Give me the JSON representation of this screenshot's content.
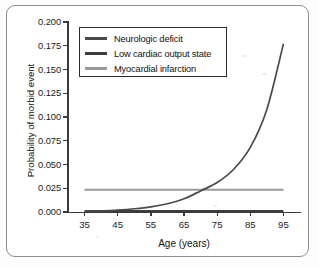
{
  "figure": {
    "background_color": "#ffffff",
    "frame_color": "#8e8e8e",
    "axis_color": "#3b3b3b"
  },
  "chart_data": {
    "type": "line",
    "title": "",
    "xlabel": "Age (years)",
    "ylabel": "Probability of morbid event",
    "xlim": [
      30,
      100
    ],
    "ylim": [
      0.0,
      0.2
    ],
    "x_ticks": [
      35,
      45,
      55,
      65,
      75,
      85,
      95
    ],
    "x_tick_labels": [
      "35",
      "45",
      "55",
      "65",
      "75",
      "85",
      "95"
    ],
    "y_ticks": [
      0.0,
      0.025,
      0.05,
      0.075,
      0.1,
      0.125,
      0.15,
      0.175,
      0.2
    ],
    "y_tick_labels": [
      "0.000",
      "0.025",
      "0.050",
      "0.075",
      "0.100",
      "0.125",
      "0.150",
      "0.175",
      "0.200"
    ],
    "grid": false,
    "legend_position": "upper left",
    "x": [
      35,
      40,
      45,
      50,
      55,
      60,
      65,
      70,
      75,
      80,
      85,
      90,
      95
    ],
    "series": [
      {
        "name": "Neurologic deficit",
        "color": "#4a4a4a",
        "values": [
          0.0008,
          0.0013,
          0.0021,
          0.0034,
          0.0054,
          0.0087,
          0.0139,
          0.0222,
          0.031,
          0.045,
          0.068,
          0.108,
          0.177
        ]
      },
      {
        "name": "Low cardiac output state",
        "color": "#3c3c3c",
        "values": [
          0.001,
          0.001,
          0.001,
          0.001,
          0.001,
          0.001,
          0.001,
          0.001,
          0.001,
          0.001,
          0.001,
          0.001,
          0.001
        ]
      },
      {
        "name": "Myocardial infarction",
        "color": "#9a9a9a",
        "values": [
          0.0235,
          0.0235,
          0.0235,
          0.0235,
          0.0235,
          0.0235,
          0.0235,
          0.0235,
          0.0235,
          0.0235,
          0.0235,
          0.0235,
          0.0235
        ]
      }
    ]
  },
  "legend": {
    "entries": [
      {
        "label": "Neurologic deficit",
        "color": "#4a4a4a"
      },
      {
        "label": "Low cardiac output state",
        "color": "#3c3c3c"
      },
      {
        "label": "Myocardial infarction",
        "color": "#9a9a9a"
      }
    ]
  }
}
